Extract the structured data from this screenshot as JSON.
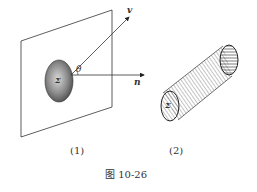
{
  "figure": {
    "caption": "图 10-26",
    "panel1": {
      "label": "(1)",
      "surface_label": "Σ",
      "angle_label": "θ",
      "vector_v": "v",
      "vector_n": "n"
    },
    "panel2": {
      "label": "(2)",
      "surface_label": "Σ"
    }
  }
}
